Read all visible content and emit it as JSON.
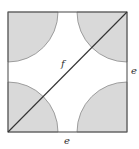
{
  "diagram": {
    "square": {
      "x": 8,
      "y": 12,
      "side": 119,
      "stroke": "#555555",
      "fill": "#ffffff"
    },
    "corner_arcs": {
      "radius": 50,
      "fill": "#d9d9d9",
      "stroke": "#8a8a8a"
    },
    "diagonal": {
      "from": "bottom-left",
      "to": "top-right",
      "stroke": "#333333"
    },
    "labels": {
      "diagonal": "f",
      "right_side": "e",
      "bottom_side": "e"
    }
  }
}
